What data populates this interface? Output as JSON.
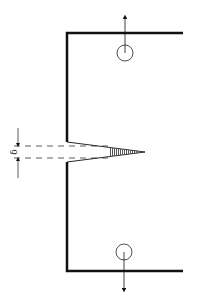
{
  "diagram": {
    "labels": {
      "crack_opening": "δ"
    },
    "colors": {
      "outline": "#111111",
      "hatch": "#555555",
      "background": "#ffffff"
    },
    "elements": {
      "specimen_outline": "C-shaped specimen body",
      "notch": "V-notch with crack tip",
      "upper_pin_hole": "loading pin hole (upper)",
      "lower_pin_hole": "loading pin hole (lower)",
      "upper_load_arrow": "upward load",
      "lower_load_arrow": "downward load",
      "dimension": "crack opening displacement δ"
    }
  }
}
